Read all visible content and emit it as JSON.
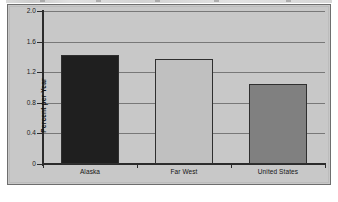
{
  "figure": {
    "background": "#ffffff",
    "panel_color": "#c8c8c8",
    "border_color": "#6e6e6e",
    "axis_color": "#2b2b2b",
    "grid_color": "#6a6a6a"
  },
  "chart_data": {
    "type": "bar",
    "title": "",
    "xlabel": "",
    "ylabel": "Percent per Year",
    "categories": [
      "Alaska",
      "Far West",
      "United States"
    ],
    "values": [
      1.42,
      1.37,
      1.05
    ],
    "series": [
      {
        "name": "Percent per Year",
        "values": [
          1.42,
          1.37,
          1.05
        ]
      }
    ],
    "bar_colors": [
      "#1f1f1f",
      "#c0c0c0",
      "#808080"
    ],
    "ylim": [
      0,
      2.0
    ],
    "yticks": [
      0,
      0.4,
      0.8,
      1.2,
      1.6,
      2.0
    ],
    "ytick_labels": [
      "0",
      "0.4",
      "0.8",
      "1.2",
      "1.6",
      "2.0"
    ],
    "grid": true,
    "grid_axis": "y",
    "legend": false,
    "legend_position": "none"
  }
}
